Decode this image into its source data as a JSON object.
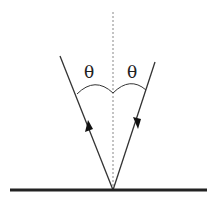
{
  "diagram": {
    "labels": {
      "incident_angle": "θ",
      "reflected_angle": "θ"
    },
    "colors": {
      "line": "#333333",
      "normal": "#888888",
      "surface": "#222222"
    }
  }
}
